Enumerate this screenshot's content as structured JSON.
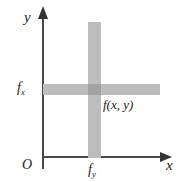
{
  "figure": {
    "background_color": "#ffffff"
  },
  "axes": {
    "y_label": "y",
    "x_label": "x",
    "origin_label": "O",
    "axis_color": "#4a4a4a"
  },
  "labels": {
    "fx_base": "f",
    "fx_sub": "x",
    "fy_base": "f",
    "fy_sub": "y",
    "function_label": "f(x, y)"
  },
  "bars": {
    "bar_color": "#bdbdbd",
    "intersection_color": "#a2a2a2"
  },
  "chart_data": {
    "type": "diagram",
    "xlabel": "x",
    "ylabel": "y",
    "annotations": [
      {
        "text": "O",
        "role": "origin"
      },
      {
        "text": "f_x",
        "role": "horizontal-band-label"
      },
      {
        "text": "f_y",
        "role": "vertical-band-label"
      },
      {
        "text": "f(x, y)",
        "role": "intersection-label"
      }
    ],
    "elements": [
      {
        "name": "horizontal-band",
        "orientation": "horizontal",
        "color": "#bdbdbd"
      },
      {
        "name": "vertical-band",
        "orientation": "vertical",
        "color": "#bdbdbd"
      },
      {
        "name": "intersection",
        "color": "#a2a2a2"
      }
    ],
    "grid": false,
    "legend": false
  }
}
